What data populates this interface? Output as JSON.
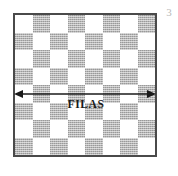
{
  "figure": {
    "number_label": "3",
    "background_color": "#ffffff",
    "width": 178,
    "height": 176
  },
  "board": {
    "name": "checkerboard",
    "columns": 8,
    "rows": 8,
    "top_left_cell": "light",
    "border_color": "#4a4a4a",
    "light_color": "#ffffff",
    "dark_color": "#b5b5b5",
    "cells": [
      [
        "light",
        "dark",
        "light",
        "dark",
        "light",
        "dark",
        "light",
        "dark"
      ],
      [
        "dark",
        "light",
        "dark",
        "light",
        "dark",
        "light",
        "dark",
        "light"
      ],
      [
        "light",
        "dark",
        "light",
        "dark",
        "light",
        "dark",
        "light",
        "dark"
      ],
      [
        "dark",
        "light",
        "dark",
        "light",
        "dark",
        "light",
        "dark",
        "light"
      ],
      [
        "light",
        "dark",
        "light",
        "dark",
        "light",
        "dark",
        "light",
        "dark"
      ],
      [
        "dark",
        "light",
        "dark",
        "light",
        "dark",
        "light",
        "dark",
        "light"
      ],
      [
        "light",
        "dark",
        "light",
        "dark",
        "light",
        "dark",
        "light",
        "dark"
      ],
      [
        "dark",
        "light",
        "dark",
        "light",
        "dark",
        "light",
        "dark",
        "light"
      ]
    ]
  },
  "annotation": {
    "arrow": {
      "name": "double-headed-horizontal-arrow",
      "color": "#1a1a1a",
      "direction": "both"
    },
    "label": "FILAS"
  }
}
